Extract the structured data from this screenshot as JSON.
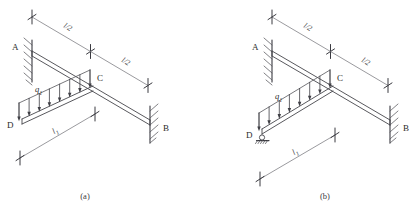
{
  "figure": {
    "type": "structural-engineering-diagram",
    "background_color": "#ffffff",
    "line_color": "#55555b",
    "text_color": "#2b2b2b"
  },
  "panels": [
    {
      "id": "a",
      "caption": "(a)",
      "support_at_D": "free",
      "nodes": [
        {
          "name": "A",
          "label": "A",
          "kind": "fixed-support-left"
        },
        {
          "name": "B",
          "label": "B",
          "kind": "fixed-support-right"
        },
        {
          "name": "C",
          "label": "C",
          "kind": "beam-junction"
        },
        {
          "name": "D",
          "label": "D",
          "kind": "free-end"
        }
      ],
      "dimensions": [
        {
          "name": "half-span-left",
          "label": "l/2"
        },
        {
          "name": "half-span-right",
          "label": "l/2"
        },
        {
          "name": "cross-beam-length",
          "label": "l",
          "subscript": "1"
        }
      ],
      "loads": [
        {
          "name": "distributed-load",
          "label": "q",
          "subscript": "1",
          "direction": "downward",
          "arrow_count": 8
        }
      ]
    },
    {
      "id": "b",
      "caption": "(b)",
      "support_at_D": "pinned",
      "nodes": [
        {
          "name": "A",
          "label": "A",
          "kind": "fixed-support-left"
        },
        {
          "name": "B",
          "label": "B",
          "kind": "fixed-support-right"
        },
        {
          "name": "C",
          "label": "C",
          "kind": "beam-junction"
        },
        {
          "name": "D",
          "label": "D",
          "kind": "pin-support"
        }
      ],
      "dimensions": [
        {
          "name": "half-span-left",
          "label": "l/2"
        },
        {
          "name": "half-span-right",
          "label": "l/2"
        },
        {
          "name": "cross-beam-length",
          "label": "l",
          "subscript": "1"
        }
      ],
      "loads": [
        {
          "name": "distributed-load",
          "label": "q",
          "subscript": "1",
          "direction": "downward",
          "arrow_count": 8
        }
      ]
    }
  ]
}
